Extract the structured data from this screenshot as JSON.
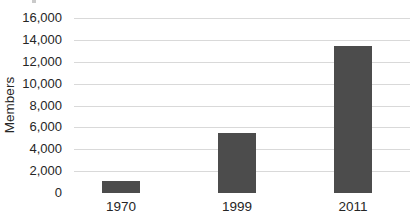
{
  "chart_data": {
    "type": "bar",
    "title": "",
    "xlabel": "",
    "ylabel": "Members",
    "categories": [
      "1970",
      "1999",
      "2011"
    ],
    "values": [
      1100,
      5500,
      13400
    ],
    "y_ticks": [
      0,
      2000,
      4000,
      6000,
      8000,
      10000,
      12000,
      14000,
      16000
    ],
    "ylim": [
      0,
      16000
    ],
    "grid": "horizontal",
    "legend": "none",
    "colors": {
      "bar": "#4c4c4c",
      "gridline": "#d9d9d9",
      "text": "#262626",
      "background": "#ffffff"
    }
  }
}
